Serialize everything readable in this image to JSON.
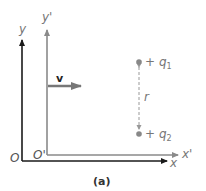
{
  "figure": {
    "caption": "(a)",
    "frame_s": {
      "origin_label": "O",
      "x_label": "x",
      "y_label": "y",
      "color": "#1a1a1a"
    },
    "frame_s_prime": {
      "origin_label": "O'",
      "x_label": "x'",
      "y_label": "y'",
      "color": "#8a8a8a"
    },
    "velocity": {
      "label": "v",
      "color": "#777777"
    },
    "charges": [
      {
        "sign": "+",
        "name": "q",
        "subscript": "1"
      },
      {
        "sign": "+",
        "name": "q",
        "subscript": "2"
      }
    ],
    "separation_label": "r",
    "charge_color": "#888888"
  }
}
